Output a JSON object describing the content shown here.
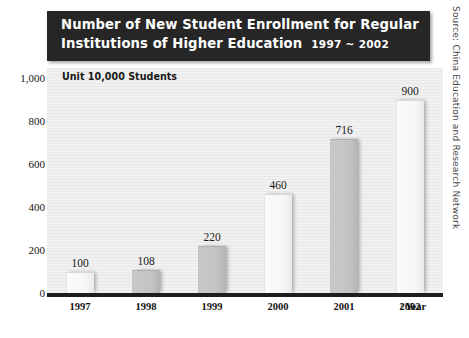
{
  "title": {
    "line1": "Number of New Student Enrollment for Regular",
    "line2": "Institutions of Higher Education",
    "range": "1997 ~ 2002"
  },
  "unit_note": "Unit 10,000 Students",
  "source_note": "Source: China Education and Research Network",
  "x_axis_caption": "/ Year",
  "colors": {
    "banner_bg": "#262626",
    "banner_text": "#ffffff",
    "plot_bg": "#f1f1f1",
    "axis_line": "#1e1e1e",
    "bar_light": "#f6f6f6",
    "bar_dark": "#c3c3c3",
    "label_text": "#131313"
  },
  "chart_data": {
    "type": "bar",
    "subtitle": "Unit 10,000 Students",
    "xlabel": "/ Year",
    "ylabel": "",
    "categories": [
      "1997",
      "1998",
      "1999",
      "2000",
      "2001",
      "2002"
    ],
    "values": [
      100,
      108,
      220,
      460,
      716,
      900
    ],
    "value_labels": [
      "100",
      "108",
      "220",
      "460",
      "716",
      "900"
    ],
    "ylim": [
      0,
      1000
    ],
    "yticks": [
      0,
      200,
      400,
      600,
      800,
      1000
    ],
    "ytick_labels": [
      "0",
      "200",
      "400",
      "600",
      "800",
      "1,000"
    ],
    "grid": false,
    "legend": false,
    "bar_styles": [
      "light",
      "dark",
      "dark",
      "light",
      "dark",
      "light"
    ],
    "series": [
      {
        "name": "New student enrollment (10,000 students)",
        "values": [
          100,
          108,
          220,
          460,
          716,
          900
        ]
      }
    ],
    "annotations": [
      "Source: China Education and Research Network"
    ]
  }
}
